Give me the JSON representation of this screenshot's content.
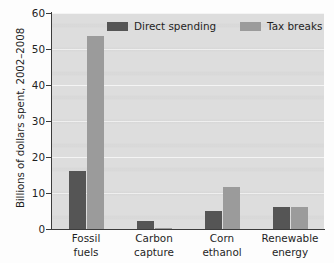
{
  "chart_data": {
    "type": "bar",
    "title": "",
    "xlabel": "",
    "ylabel": "Billions of dollars spent, 2002–2008",
    "ylim": [
      0,
      60
    ],
    "yticks": [
      0,
      10,
      20,
      30,
      40,
      50,
      60
    ],
    "ytick_labels": [
      "0",
      "10",
      "20",
      "30",
      "40",
      "50",
      "60"
    ],
    "grid": true,
    "grid_axis": "y",
    "legend_position": "top-center-inside",
    "categories": [
      "Fossil fuels",
      "Carbon capture",
      "Corn ethanol",
      "Renewable energy"
    ],
    "category_lines": [
      [
        "Fossil",
        "fuels"
      ],
      [
        "Carbon",
        "capture"
      ],
      [
        "Corn",
        "ethanol"
      ],
      [
        "Renewable",
        "energy"
      ]
    ],
    "series": [
      {
        "name": "Direct spending",
        "color": "#555555",
        "values": [
          16.2,
          2.3,
          5.1,
          6.1
        ]
      },
      {
        "name": "Tax breaks",
        "color": "#9b9b9b",
        "values": [
          53.7,
          0.3,
          11.8,
          6.2
        ]
      }
    ]
  },
  "legend": {
    "items": [
      {
        "label": "Direct spending",
        "swatch": "direct"
      },
      {
        "label": "Tax breaks",
        "swatch": "tax"
      }
    ]
  },
  "colors": {
    "direct_spending": "#555555",
    "tax_breaks": "#9b9b9b",
    "plot_background": "#dddddd",
    "gridline": "#f4f4f4",
    "axis": "#3c3c3c",
    "page_background": "#fdfdfd",
    "text": "#1f1f1f"
  }
}
